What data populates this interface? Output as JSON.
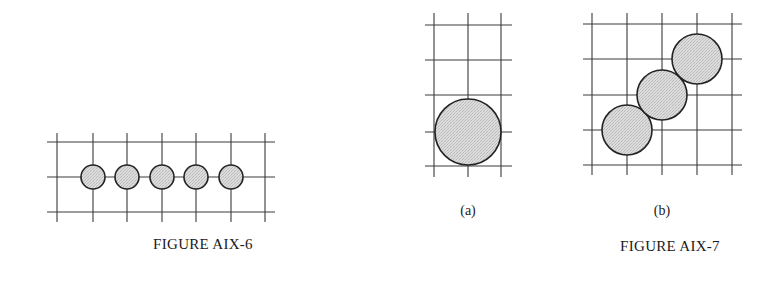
{
  "colors": {
    "background": "#ffffff",
    "grid_line": "#3a3a3a",
    "circle_outline": "#222222",
    "circle_fill": "#d4d4d4"
  },
  "figures": [
    {
      "id": "aix6",
      "caption": "FIGURE AIX-6",
      "caption_pos": [
        203,
        236
      ],
      "grid": {
        "x_lines": [
          57,
          93,
          127,
          162,
          196,
          231,
          265
        ],
        "y_lines": [
          142,
          177,
          212
        ],
        "x_extent": [
          47,
          275
        ],
        "y_extent": [
          133,
          222
        ]
      },
      "circles": [
        {
          "cx": 93,
          "cy": 177,
          "r": 12
        },
        {
          "cx": 127,
          "cy": 177,
          "r": 12
        },
        {
          "cx": 162,
          "cy": 177,
          "r": 12
        },
        {
          "cx": 196,
          "cy": 177,
          "r": 12
        },
        {
          "cx": 231,
          "cy": 177,
          "r": 12
        }
      ]
    },
    {
      "id": "aix7a",
      "sublabel": "(a)",
      "sublabel_pos": [
        468,
        203
      ],
      "grid": {
        "x_lines": [
          434,
          468,
          501
        ],
        "y_lines": [
          25,
          60,
          95,
          132,
          166
        ],
        "x_extent": [
          425,
          512
        ],
        "y_extent": [
          13,
          177
        ]
      },
      "circles": [
        {
          "cx": 468,
          "cy": 132,
          "r": 33
        }
      ]
    },
    {
      "id": "aix7b",
      "sublabel": "(b)",
      "sublabel_pos": [
        662,
        203
      ],
      "caption": "FIGURE AIX-7",
      "caption_pos": [
        670,
        238
      ],
      "grid": {
        "x_lines": [
          592,
          627,
          662,
          697,
          732
        ],
        "y_lines": [
          24,
          59,
          95,
          130,
          165
        ],
        "x_extent": [
          583,
          742
        ],
        "y_extent": [
          13,
          175
        ]
      },
      "circles": [
        {
          "cx": 627,
          "cy": 130,
          "r": 25
        },
        {
          "cx": 662,
          "cy": 95,
          "r": 25
        },
        {
          "cx": 697,
          "cy": 59,
          "r": 25
        }
      ]
    }
  ],
  "labels": {
    "fig6_caption": "FIGURE AIX-6",
    "fig7a_sublabel": "(a)",
    "fig7b_sublabel": "(b)",
    "fig7_caption": "FIGURE AIX-7"
  }
}
